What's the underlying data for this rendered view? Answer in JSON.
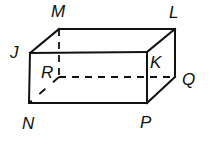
{
  "figure": {
    "type": "rectangular prism",
    "vertices": [
      {
        "name": "J",
        "x": 30,
        "y": 53,
        "label_x": 10,
        "label_y": 58
      },
      {
        "name": "M",
        "x": 59,
        "y": 29,
        "label_x": 51,
        "label_y": 17
      },
      {
        "name": "L",
        "x": 175,
        "y": 29,
        "label_x": 169,
        "label_y": 18
      },
      {
        "name": "K",
        "x": 147,
        "y": 52,
        "label_x": 150,
        "label_y": 68
      },
      {
        "name": "N",
        "x": 29,
        "y": 103,
        "label_x": 22,
        "label_y": 129
      },
      {
        "name": "P",
        "x": 147,
        "y": 103,
        "label_x": 140,
        "label_y": 128
      },
      {
        "name": "Q",
        "x": 175,
        "y": 77,
        "label_x": 182,
        "label_y": 85
      },
      {
        "name": "R",
        "x": 59,
        "y": 77,
        "label_x": 41,
        "label_y": 78
      }
    ],
    "visible_edges": [
      "J-M",
      "M-L",
      "L-K",
      "K-J",
      "J-N",
      "N-P",
      "P-K",
      "P-Q",
      "Q-L"
    ],
    "hidden_edges": [
      "M-R",
      "R-Q",
      "R-N"
    ],
    "labels": {
      "J": "J",
      "M": "M",
      "L": "L",
      "K": "K",
      "N": "N",
      "P": "P",
      "Q": "Q",
      "R": "R"
    }
  }
}
